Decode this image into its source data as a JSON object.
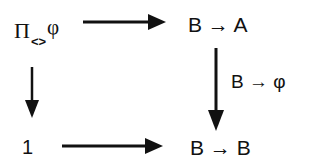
{
  "diagram": {
    "type": "commutative-diagram",
    "nodes": {
      "top_left": {
        "main": "Π",
        "subscript": "<>",
        "superscript": "φ"
      },
      "top_right": {
        "left": "B",
        "arrow": "→",
        "right": "A"
      },
      "bottom_left": {
        "text": "1"
      },
      "bottom_right": {
        "left": "B",
        "arrow": "→",
        "right": "B"
      }
    },
    "edges": [
      {
        "from": "top_left",
        "to": "top_right",
        "label": ""
      },
      {
        "from": "top_left",
        "to": "bottom_left",
        "label": ""
      },
      {
        "from": "top_right",
        "to": "bottom_right",
        "label": "B → φ"
      },
      {
        "from": "bottom_left",
        "to": "bottom_right",
        "label": ""
      }
    ],
    "edge_label_right": "B → φ",
    "colors": {
      "ink": "#111111",
      "background": "#ffffff"
    }
  }
}
